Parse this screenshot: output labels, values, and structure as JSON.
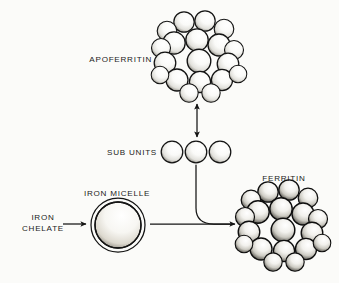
{
  "diagram": {
    "background_color": "#fbfbf9",
    "ink_color": "#141414",
    "labels": {
      "apoferritin": "APOFERRITIN",
      "sub_units": "SUB UNITS",
      "iron_micelle": "IRON MICELLE",
      "iron_chelate_line1": "IRON",
      "iron_chelate_line2": "CHELATE",
      "ferritin": "FERRITIN"
    },
    "nodes": [
      {
        "id": "apoferritin",
        "label": "APOFERRITIN",
        "shape": "sphere-cluster",
        "sphere_count": 19,
        "cx": 200,
        "cy": 58,
        "radius": 42,
        "shading": "light",
        "label_x": 152,
        "label_y": 62,
        "label_anchor": "end"
      },
      {
        "id": "sub-units",
        "label": "SUB UNITS",
        "shape": "sphere-row",
        "sphere_count": 3,
        "cy": 152,
        "sphere_radius": 11,
        "centers_x": [
          172,
          196,
          220
        ],
        "shading": "light",
        "label_x": 156,
        "label_y": 155,
        "label_anchor": "end"
      },
      {
        "id": "iron-micelle",
        "label": "IRON MICELLE",
        "shape": "double-ring-sphere",
        "cx": 118,
        "cy": 225,
        "outer_radius": 27,
        "inner_radius": 23,
        "shading": "stippled",
        "label_x": 117,
        "label_y": 196,
        "label_anchor": "middle"
      },
      {
        "id": "iron-chelate",
        "label": "IRON CHELATE",
        "shape": "text-only",
        "label_x": 43,
        "label_y": 219,
        "label_anchor": "middle"
      },
      {
        "id": "ferritin",
        "label": "FERRITIN",
        "shape": "sphere-cluster",
        "sphere_count": 19,
        "cx": 284,
        "cy": 227,
        "radius": 42,
        "shading": "dark",
        "label_x": 284,
        "label_y": 181,
        "label_anchor": "middle"
      }
    ],
    "arrows": [
      {
        "id": "chelate-to-micelle",
        "type": "straight",
        "direction": "right",
        "from": "iron-chelate",
        "to": "iron-micelle",
        "x1": 63,
        "y1": 224,
        "x2": 88,
        "y2": 224,
        "heads": 1
      },
      {
        "id": "apoferritin-subunits",
        "type": "straight",
        "direction": "both",
        "from": "sub-units",
        "to": "apoferritin",
        "x1": 197,
        "y1": 138,
        "x2": 197,
        "y2": 102,
        "heads": 2
      },
      {
        "id": "micelle-to-ferritin",
        "type": "straight",
        "direction": "right",
        "from": "iron-micelle",
        "to": "ferritin",
        "x1": 150,
        "y1": 224,
        "x2": 237,
        "y2": 224,
        "heads": 1
      },
      {
        "id": "subunits-to-ferritin",
        "type": "curve",
        "direction": "down-right",
        "from": "sub-units",
        "to": "ferritin",
        "x1": 196,
        "y1": 166,
        "x2": 228,
        "y2": 224,
        "heads": 0
      }
    ]
  }
}
